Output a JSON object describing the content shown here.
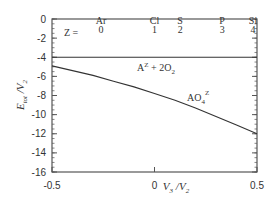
{
  "chart_data": {
    "type": "line",
    "title": "",
    "xlabel": "V3/V2",
    "ylabel": "E_tot/V2",
    "xlim": [
      -0.5,
      0.5
    ],
    "ylim": [
      -16,
      0
    ],
    "xticks": [
      "-0.5",
      "0",
      "0.5"
    ],
    "yticks": [
      "0",
      "-2",
      "-4",
      "-6",
      "-8",
      "-10",
      "-12",
      "-14",
      "-16"
    ],
    "grid": false,
    "series": [
      {
        "name": "A^Z + 2O2",
        "x": [
          -0.5,
          0.5
        ],
        "values": [
          -4,
          -4
        ]
      },
      {
        "name": "AO4^Z",
        "x": [
          -0.5,
          -0.4,
          -0.3,
          -0.2,
          -0.1,
          0.0,
          0.1,
          0.2,
          0.3,
          0.4,
          0.5
        ],
        "values": [
          -4.9,
          -5.4,
          -5.9,
          -6.5,
          -7.1,
          -7.8,
          -8.5,
          -9.3,
          -10.2,
          -11.1,
          -12.0
        ]
      }
    ],
    "annotations": {
      "z_label": "Z =",
      "top_markers": [
        {
          "element": "Ar",
          "z": "0",
          "x": -0.5
        },
        {
          "element": "Cl",
          "z": "1",
          "x": 0.0
        },
        {
          "element": "S",
          "z": "2",
          "x": 0.125
        },
        {
          "element": "P",
          "z": "3",
          "x": 0.33
        },
        {
          "element": "Si",
          "z": "4",
          "x": 0.5
        }
      ],
      "line_labels": [
        {
          "text": "A",
          "sup": "Z",
          "rest": " + 2O",
          "sub": "2"
        },
        {
          "text": "AO",
          "sub": "4",
          "sup": "Z"
        }
      ]
    }
  },
  "colors": {
    "axis": "#555555",
    "line": "#333333",
    "text": "#333333"
  }
}
